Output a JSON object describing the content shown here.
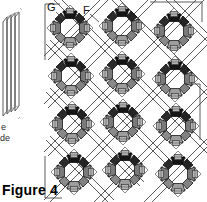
{
  "figure": {
    "caption": "Figure 4",
    "labels": [
      {
        "id": "G",
        "text": "G",
        "x": 47,
        "y": 2
      },
      {
        "id": "F",
        "text": "F",
        "x": 83,
        "y": 5
      }
    ]
  },
  "edge_artifact": {
    "description": "partial-adjacent-figure",
    "text_fragments": [
      {
        "id": "frag-e",
        "text": "e"
      },
      {
        "id": "frag-de",
        "text": "de"
      }
    ]
  },
  "colors": {
    "background": "#ffffff",
    "line": "#4a4a4a",
    "outline": "#000000",
    "segment_dark": "#1a1a1a",
    "segment_mid": "#767676",
    "segment_light": "#9b9b9b",
    "corner_block": "#b4b4b4",
    "corner_block_edge": "#5a5a5a",
    "caption_text": "#000000",
    "label_text": "#111111"
  },
  "lattice": {
    "type": "diagonal-double-line-grid",
    "angle_degrees": 45,
    "rows": 4,
    "columns": 3,
    "cell_size": 52,
    "motif_count": 12,
    "motifs": [
      {
        "id": "motif-r1c1",
        "row": 1,
        "col": 1,
        "cx": 70,
        "cy": 28
      },
      {
        "id": "motif-r1c2",
        "row": 1,
        "col": 2,
        "cx": 122,
        "cy": 26
      },
      {
        "id": "motif-r1c3",
        "row": 1,
        "col": 3,
        "cx": 174,
        "cy": 31
      },
      {
        "id": "motif-r2c1",
        "row": 2,
        "col": 1,
        "cx": 71,
        "cy": 76
      },
      {
        "id": "motif-r2c2",
        "row": 2,
        "col": 2,
        "cx": 122,
        "cy": 74
      },
      {
        "id": "motif-r2c3",
        "row": 2,
        "col": 3,
        "cx": 175,
        "cy": 79
      },
      {
        "id": "motif-r3c1",
        "row": 3,
        "col": 1,
        "cx": 72,
        "cy": 124
      },
      {
        "id": "motif-r3c2",
        "row": 3,
        "col": 2,
        "cx": 123,
        "cy": 122
      },
      {
        "id": "motif-r3c3",
        "row": 3,
        "col": 3,
        "cx": 176,
        "cy": 126
      },
      {
        "id": "motif-r4c1",
        "row": 4,
        "col": 1,
        "cx": 74,
        "cy": 172
      },
      {
        "id": "motif-r4c2",
        "row": 4,
        "col": 2,
        "cx": 125,
        "cy": 170
      },
      {
        "id": "motif-r4c3",
        "row": 4,
        "col": 3,
        "cx": 178,
        "cy": 174
      }
    ],
    "motif": {
      "type": "octagonal-ring-in-diamond",
      "segment_count": 8,
      "corner_block_count": 4,
      "diamond_half_diagonal": 23,
      "ring_outer_radius": 17,
      "ring_inner_radius": 9.5
    }
  }
}
